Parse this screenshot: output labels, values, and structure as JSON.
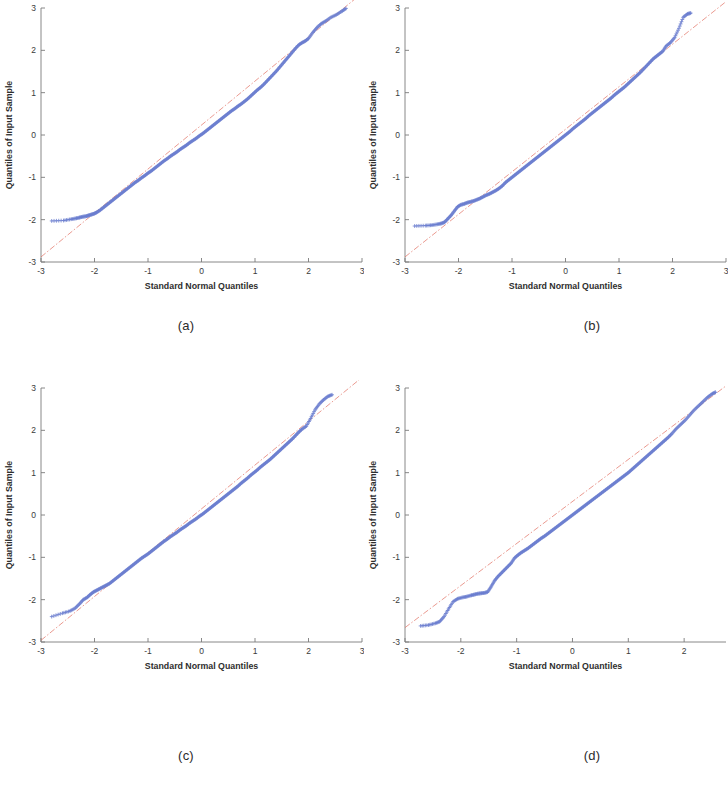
{
  "figure": {
    "kind": "2x2-grid-of-qq-plots",
    "background": "#ffffff"
  },
  "style": {
    "marker_color": "#6b7ed0",
    "reference_line_color": "#e06a5a",
    "axis_color": "#7a7a7a",
    "text_color": "#2e2e2e"
  },
  "captions": {
    "a": "(a)",
    "b": "(b)",
    "c": "(c)",
    "d": "(d)"
  },
  "chart_data": [
    {
      "id": "a",
      "type": "scatter",
      "subtype": "qq-plot",
      "title": "",
      "xlabel": "Standard Normal Quantiles",
      "ylabel": "Quantiles of Input Sample",
      "xlim": [
        -3,
        3
      ],
      "ylim": [
        -3,
        3
      ],
      "xticks": [
        -3,
        -2,
        -1,
        0,
        1,
        2,
        3
      ],
      "xticklabels": [
        "-3",
        "-2",
        "-1",
        "0",
        "1",
        "2",
        "3"
      ],
      "yticks": [
        -3,
        -2,
        -1,
        0,
        1,
        2,
        3
      ],
      "yticklabels": [
        "-3",
        "-2",
        "-1",
        "0",
        "1",
        "2",
        "3"
      ],
      "grid": false,
      "legend": null,
      "marker": "+",
      "reference_line": {
        "style": "dash-dot",
        "color": "#e06a5a",
        "x": [
          -3.0,
          3.0
        ],
        "y": [
          -2.88,
          3.35
        ]
      },
      "series": [
        {
          "name": "sample quantiles",
          "x": [
            -2.8,
            -2.58,
            -2.44,
            -2.35,
            -2.28,
            -2.22,
            -2.16,
            -2.11,
            -2.06,
            -2.01,
            -1.96,
            -1.9,
            -1.84,
            -1.78,
            -1.72,
            -1.66,
            -1.6,
            -1.54,
            -1.48,
            -1.42,
            -1.36,
            -1.3,
            -1.24,
            -1.18,
            -1.12,
            -1.06,
            -1.0,
            -0.94,
            -0.88,
            -0.82,
            -0.76,
            -0.7,
            -0.64,
            -0.58,
            -0.52,
            -0.46,
            -0.4,
            -0.34,
            -0.28,
            -0.22,
            -0.16,
            -0.1,
            -0.04,
            0.02,
            0.08,
            0.14,
            0.2,
            0.26,
            0.32,
            0.38,
            0.44,
            0.5,
            0.56,
            0.62,
            0.68,
            0.74,
            0.8,
            0.86,
            0.92,
            0.98,
            1.04,
            1.1,
            1.16,
            1.22,
            1.28,
            1.34,
            1.4,
            1.46,
            1.52,
            1.58,
            1.64,
            1.7,
            1.76,
            1.82,
            1.88,
            1.94,
            2.0,
            2.08,
            2.16,
            2.24,
            2.32,
            2.42,
            2.52,
            2.62,
            2.7
          ],
          "y": [
            -2.03,
            -2.02,
            -1.99,
            -1.97,
            -1.95,
            -1.93,
            -1.92,
            -1.9,
            -1.88,
            -1.86,
            -1.83,
            -1.78,
            -1.72,
            -1.66,
            -1.6,
            -1.54,
            -1.48,
            -1.42,
            -1.36,
            -1.3,
            -1.24,
            -1.18,
            -1.12,
            -1.07,
            -1.01,
            -0.96,
            -0.9,
            -0.85,
            -0.79,
            -0.73,
            -0.67,
            -0.61,
            -0.56,
            -0.5,
            -0.45,
            -0.4,
            -0.34,
            -0.29,
            -0.24,
            -0.18,
            -0.13,
            -0.08,
            -0.02,
            0.03,
            0.09,
            0.15,
            0.21,
            0.27,
            0.33,
            0.39,
            0.45,
            0.51,
            0.57,
            0.62,
            0.68,
            0.73,
            0.79,
            0.85,
            0.92,
            0.99,
            1.06,
            1.12,
            1.19,
            1.27,
            1.35,
            1.43,
            1.51,
            1.6,
            1.69,
            1.78,
            1.87,
            1.96,
            2.05,
            2.13,
            2.18,
            2.22,
            2.28,
            2.42,
            2.54,
            2.63,
            2.69,
            2.78,
            2.84,
            2.92,
            2.99
          ]
        }
      ]
    },
    {
      "id": "b",
      "type": "scatter",
      "subtype": "qq-plot",
      "title": "",
      "xlabel": "Standard Normal Quantiles",
      "ylabel": "Quantiles of Input Sample",
      "xlim": [
        -3,
        3
      ],
      "ylim": [
        -3,
        3
      ],
      "xticks": [
        -3,
        -2,
        -1,
        0,
        1,
        2,
        3
      ],
      "xticklabels": [
        "-3",
        "-2",
        "-1",
        "0",
        "1",
        "2",
        "3"
      ],
      "yticks": [
        -3,
        -2,
        -1,
        0,
        1,
        2,
        3
      ],
      "yticklabels": [
        "-3",
        "-2",
        "-1",
        "0",
        "1",
        "2",
        "3"
      ],
      "grid": false,
      "legend": null,
      "marker": "+",
      "reference_line": {
        "style": "dash-dot",
        "color": "#e06a5a",
        "x": [
          -3.0,
          3.0
        ],
        "y": [
          -2.88,
          3.15
        ]
      },
      "series": [
        {
          "name": "sample quantiles",
          "x": [
            -2.82,
            -2.62,
            -2.5,
            -2.4,
            -2.32,
            -2.26,
            -2.2,
            -2.14,
            -2.08,
            -2.02,
            -1.96,
            -1.9,
            -1.84,
            -1.78,
            -1.72,
            -1.66,
            -1.6,
            -1.54,
            -1.48,
            -1.42,
            -1.36,
            -1.3,
            -1.24,
            -1.18,
            -1.12,
            -1.06,
            -1.0,
            -0.94,
            -0.88,
            -0.82,
            -0.76,
            -0.7,
            -0.64,
            -0.58,
            -0.52,
            -0.46,
            -0.4,
            -0.34,
            -0.28,
            -0.22,
            -0.16,
            -0.1,
            -0.04,
            0.02,
            0.08,
            0.14,
            0.2,
            0.26,
            0.32,
            0.38,
            0.44,
            0.5,
            0.56,
            0.62,
            0.68,
            0.74,
            0.8,
            0.86,
            0.92,
            0.98,
            1.04,
            1.1,
            1.16,
            1.22,
            1.28,
            1.34,
            1.4,
            1.46,
            1.52,
            1.58,
            1.64,
            1.7,
            1.76,
            1.82,
            1.88,
            1.96,
            2.04,
            2.12,
            2.2,
            2.28,
            2.34
          ],
          "y": [
            -2.15,
            -2.14,
            -2.13,
            -2.11,
            -2.09,
            -2.06,
            -1.98,
            -1.9,
            -1.8,
            -1.7,
            -1.65,
            -1.63,
            -1.6,
            -1.58,
            -1.56,
            -1.53,
            -1.5,
            -1.46,
            -1.42,
            -1.39,
            -1.35,
            -1.31,
            -1.26,
            -1.2,
            -1.12,
            -1.06,
            -1.0,
            -0.94,
            -0.88,
            -0.82,
            -0.76,
            -0.7,
            -0.64,
            -0.58,
            -0.52,
            -0.46,
            -0.4,
            -0.34,
            -0.28,
            -0.22,
            -0.16,
            -0.1,
            -0.04,
            0.02,
            0.08,
            0.15,
            0.21,
            0.27,
            0.33,
            0.39,
            0.46,
            0.52,
            0.58,
            0.64,
            0.7,
            0.76,
            0.82,
            0.88,
            0.95,
            1.01,
            1.07,
            1.13,
            1.2,
            1.27,
            1.34,
            1.41,
            1.48,
            1.56,
            1.64,
            1.72,
            1.8,
            1.86,
            1.92,
            1.98,
            2.1,
            2.18,
            2.3,
            2.52,
            2.78,
            2.86,
            2.88
          ]
        }
      ]
    },
    {
      "id": "c",
      "type": "scatter",
      "subtype": "qq-plot",
      "title": "",
      "xlabel": "Standard Normal Quantiles",
      "ylabel": "Quantiles of Input Sample",
      "xlim": [
        -3,
        3
      ],
      "ylim": [
        -3,
        3
      ],
      "xticks": [
        -3,
        -2,
        -1,
        0,
        1,
        2,
        3
      ],
      "xticklabels": [
        "-3",
        "-2",
        "-1",
        "0",
        "1",
        "2",
        "3"
      ],
      "yticks": [
        -3,
        -2,
        -1,
        0,
        1,
        2,
        3
      ],
      "yticklabels": [
        "-3",
        "-2",
        "-1",
        "0",
        "1",
        "2",
        "3"
      ],
      "grid": false,
      "legend": null,
      "marker": "+",
      "reference_line": {
        "style": "dash-dot",
        "color": "#e06a5a",
        "x": [
          -3.0,
          3.0
        ],
        "y": [
          -2.96,
          3.25
        ]
      },
      "series": [
        {
          "name": "sample quantiles",
          "x": [
            -2.8,
            -2.6,
            -2.46,
            -2.36,
            -2.28,
            -2.21,
            -2.14,
            -2.08,
            -2.02,
            -1.96,
            -1.9,
            -1.84,
            -1.78,
            -1.72,
            -1.66,
            -1.6,
            -1.54,
            -1.48,
            -1.42,
            -1.36,
            -1.3,
            -1.24,
            -1.18,
            -1.12,
            -1.06,
            -1.0,
            -0.94,
            -0.88,
            -0.82,
            -0.76,
            -0.7,
            -0.64,
            -0.58,
            -0.52,
            -0.46,
            -0.4,
            -0.34,
            -0.28,
            -0.22,
            -0.16,
            -0.1,
            -0.04,
            0.02,
            0.08,
            0.14,
            0.2,
            0.26,
            0.32,
            0.38,
            0.44,
            0.5,
            0.56,
            0.62,
            0.68,
            0.74,
            0.8,
            0.86,
            0.92,
            0.98,
            1.04,
            1.1,
            1.16,
            1.22,
            1.28,
            1.34,
            1.4,
            1.46,
            1.52,
            1.58,
            1.64,
            1.7,
            1.76,
            1.82,
            1.88,
            1.96,
            2.04,
            2.12,
            2.2,
            2.28,
            2.36,
            2.44
          ],
          "y": [
            -2.4,
            -2.32,
            -2.27,
            -2.2,
            -2.1,
            -2.0,
            -1.95,
            -1.88,
            -1.82,
            -1.78,
            -1.74,
            -1.7,
            -1.66,
            -1.62,
            -1.56,
            -1.5,
            -1.44,
            -1.38,
            -1.32,
            -1.26,
            -1.2,
            -1.14,
            -1.08,
            -1.02,
            -0.97,
            -0.92,
            -0.86,
            -0.8,
            -0.74,
            -0.68,
            -0.62,
            -0.57,
            -0.51,
            -0.46,
            -0.41,
            -0.35,
            -0.3,
            -0.25,
            -0.19,
            -0.14,
            -0.09,
            -0.03,
            0.02,
            0.08,
            0.14,
            0.2,
            0.26,
            0.32,
            0.38,
            0.44,
            0.5,
            0.56,
            0.62,
            0.68,
            0.75,
            0.81,
            0.87,
            0.94,
            1.0,
            1.06,
            1.13,
            1.19,
            1.25,
            1.31,
            1.38,
            1.45,
            1.52,
            1.59,
            1.66,
            1.73,
            1.8,
            1.88,
            1.96,
            2.03,
            2.1,
            2.28,
            2.48,
            2.62,
            2.72,
            2.8,
            2.84
          ]
        }
      ]
    },
    {
      "id": "d",
      "type": "scatter",
      "subtype": "qq-plot",
      "title": "",
      "xlabel": "Standard Normal Quantiles",
      "ylabel": "Quantiles of Input Sample",
      "xlim": [
        -3,
        2.75
      ],
      "ylim": [
        -3,
        3
      ],
      "xticks": [
        -3,
        -2,
        -1,
        0,
        1,
        2
      ],
      "xticklabels": [
        "-3",
        "-2",
        "-1",
        "0",
        "1",
        "2"
      ],
      "yticks": [
        -3,
        -2,
        -1,
        0,
        1,
        2,
        3
      ],
      "yticklabels": [
        "-3",
        "-2",
        "-1",
        "0",
        "1",
        "2",
        "3"
      ],
      "grid": false,
      "legend": null,
      "marker": "+",
      "reference_line": {
        "style": "dash-dot",
        "color": "#e06a5a",
        "x": [
          -3.0,
          2.75
        ],
        "y": [
          -2.66,
          3.05
        ]
      },
      "series": [
        {
          "name": "sample quantiles",
          "x": [
            -2.72,
            -2.58,
            -2.46,
            -2.38,
            -2.3,
            -2.22,
            -2.14,
            -2.06,
            -1.98,
            -1.9,
            -1.82,
            -1.76,
            -1.7,
            -1.64,
            -1.58,
            -1.52,
            -1.46,
            -1.4,
            -1.34,
            -1.28,
            -1.22,
            -1.16,
            -1.1,
            -1.04,
            -0.98,
            -0.92,
            -0.86,
            -0.8,
            -0.74,
            -0.68,
            -0.62,
            -0.56,
            -0.5,
            -0.44,
            -0.38,
            -0.32,
            -0.26,
            -0.2,
            -0.14,
            -0.08,
            -0.02,
            0.04,
            0.1,
            0.16,
            0.22,
            0.28,
            0.34,
            0.4,
            0.46,
            0.52,
            0.58,
            0.64,
            0.7,
            0.76,
            0.82,
            0.88,
            0.94,
            1.0,
            1.06,
            1.12,
            1.18,
            1.24,
            1.3,
            1.36,
            1.42,
            1.48,
            1.54,
            1.6,
            1.66,
            1.72,
            1.78,
            1.86,
            1.94,
            2.02,
            2.1,
            2.18,
            2.26,
            2.34,
            2.42,
            2.5,
            2.56
          ],
          "y": [
            -2.62,
            -2.6,
            -2.56,
            -2.52,
            -2.4,
            -2.22,
            -2.05,
            -1.98,
            -1.95,
            -1.93,
            -1.9,
            -1.88,
            -1.86,
            -1.85,
            -1.84,
            -1.82,
            -1.7,
            -1.56,
            -1.46,
            -1.38,
            -1.3,
            -1.22,
            -1.14,
            -1.02,
            -0.95,
            -0.89,
            -0.84,
            -0.79,
            -0.73,
            -0.67,
            -0.61,
            -0.55,
            -0.5,
            -0.44,
            -0.38,
            -0.32,
            -0.26,
            -0.2,
            -0.14,
            -0.08,
            -0.02,
            0.04,
            0.1,
            0.16,
            0.22,
            0.28,
            0.34,
            0.4,
            0.46,
            0.52,
            0.58,
            0.64,
            0.7,
            0.76,
            0.82,
            0.88,
            0.94,
            1.0,
            1.07,
            1.14,
            1.21,
            1.28,
            1.35,
            1.42,
            1.49,
            1.56,
            1.63,
            1.7,
            1.77,
            1.84,
            1.92,
            2.04,
            2.14,
            2.24,
            2.36,
            2.48,
            2.58,
            2.68,
            2.78,
            2.86,
            2.9
          ]
        }
      ]
    }
  ]
}
